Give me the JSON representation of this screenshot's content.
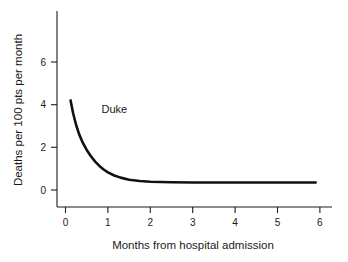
{
  "chart_data": {
    "type": "line",
    "title": "",
    "subtitle": "",
    "xlabel": "Months from hospital admission",
    "ylabel": "Deaths per 100 pts per month",
    "xlim": [
      0,
      6.4
    ],
    "ylim": [
      0,
      7.0
    ],
    "xticks": [
      0,
      1,
      2,
      3,
      4,
      5,
      6
    ],
    "xtick_labels": [
      "0",
      "1",
      "2",
      "3",
      "4",
      "5",
      "6"
    ],
    "yticks": [
      0,
      2,
      4,
      6
    ],
    "ytick_labels": [
      "0",
      "2",
      "4",
      "6"
    ],
    "grid": false,
    "legend": "none",
    "annotations": [
      {
        "text": "Duke",
        "x": 0.85,
        "y": 3.6
      }
    ],
    "series": [
      {
        "name": "Duke",
        "color": "#111111",
        "x": [
          0.12,
          0.18,
          0.25,
          0.32,
          0.4,
          0.5,
          0.6,
          0.7,
          0.8,
          0.9,
          1.0,
          1.15,
          1.3,
          1.5,
          1.75,
          2.0,
          2.5,
          3.0,
          3.5,
          4.0,
          4.5,
          5.0,
          5.5,
          5.9
        ],
        "y": [
          4.2,
          3.6,
          3.05,
          2.62,
          2.25,
          1.88,
          1.58,
          1.33,
          1.13,
          0.96,
          0.83,
          0.68,
          0.58,
          0.48,
          0.42,
          0.39,
          0.36,
          0.35,
          0.35,
          0.35,
          0.35,
          0.35,
          0.35,
          0.35
        ]
      }
    ]
  },
  "axes": {
    "x_title": "Months from hospital admission",
    "y_title": "Deaths per 100 pts per month"
  }
}
